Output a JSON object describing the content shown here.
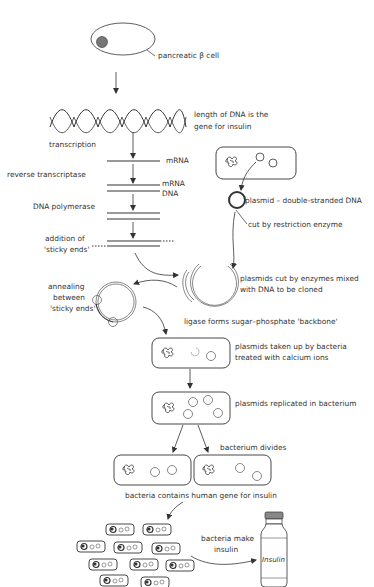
{
  "diagram": {
    "colors": {
      "line": "#333333",
      "nucleus": "#777777",
      "background": "#ffffff",
      "bottle_cap": "#888888"
    },
    "labels": {
      "cell": "pancreatic β cell",
      "gene_line1": "length of DNA is the",
      "gene_line2": "gene for insulin",
      "transcription": "transcription",
      "mrna": "mRNA",
      "reverse_transcriptase": "reverse transcriptase",
      "mrna2": "mRNA",
      "dna": "DNA",
      "dna_polymerase": "DNA polymerase",
      "sticky_line1": "addition of",
      "sticky_line2": "'sticky ends'",
      "plasmid": "plasmid – double-stranded DNA",
      "cut": "cut by restriction enzyme",
      "mixed_line1": "plasmids cut by enzymes mixed",
      "mixed_line2": "with DNA to be cloned",
      "annealing_line1": "annealing",
      "annealing_line2": "between",
      "annealing_line3": "'sticky ends'",
      "ligase": "ligase forms sugar–phosphate 'backbone'",
      "uptake_line1": "plasmids taken up by bacteria",
      "uptake_line2": "treated with calcium ions",
      "replicated": "plasmids replicated in bacterium",
      "divides": "bacterium divides",
      "contains": "bacteria contains human gene for insulin",
      "make_line1": "bacteria make",
      "make_line2": "insulin",
      "bottle": "Insulin"
    },
    "steps": [
      "pancreatic β cell",
      "length of DNA is the gene for insulin",
      "transcription",
      "reverse transcriptase",
      "DNA polymerase",
      "addition of 'sticky ends'",
      "plasmid – double-stranded DNA cut by restriction enzyme",
      "plasmids cut by enzymes mixed with DNA to be cloned",
      "annealing between 'sticky ends'",
      "ligase forms sugar–phosphate 'backbone'",
      "plasmids taken up by bacteria treated with calcium ions",
      "plasmids replicated in bacterium",
      "bacterium divides",
      "bacteria contains human gene for insulin",
      "bacteria make insulin"
    ]
  }
}
